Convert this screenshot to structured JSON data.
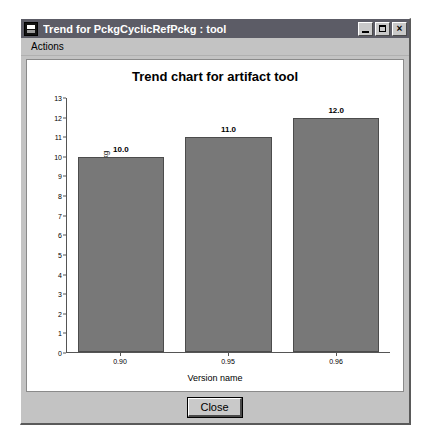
{
  "window": {
    "title": "Trend for PckgCyclicRefPckg : tool",
    "icon": "window-app-icon",
    "buttons": {
      "minimize": "_",
      "maximize": "□",
      "close": "×"
    }
  },
  "menubar": {
    "items": [
      {
        "label": "Actions"
      }
    ]
  },
  "footer": {
    "close_label": "Close"
  },
  "chart_data": {
    "type": "bar",
    "title": "Trend chart for artifact tool",
    "categories": [
      "0.90",
      "0.95",
      "0.96"
    ],
    "values": [
      10.0,
      12.0,
      12.0
    ],
    "bar_labels": [
      "10.0",
      "11.0",
      "12.0"
    ],
    "xlabel": "Version name",
    "ylabel": "Metric value for metric PckgCyclicRefPckg",
    "ylim": [
      0,
      13
    ],
    "yticks": [
      0,
      1,
      2,
      3,
      4,
      5,
      6,
      7,
      8,
      9,
      10,
      11,
      12,
      13
    ],
    "ytick_labels": [
      "0",
      "1",
      "2",
      "3",
      "4",
      "5",
      "6",
      "7",
      "8",
      "9",
      "10",
      "11",
      "12",
      "13"
    ],
    "grid": false,
    "legend": null,
    "series": [
      {
        "name": "tool",
        "values": [
          10.0,
          11.0,
          12.0
        ]
      }
    ],
    "bar_color": "#787878",
    "bar_border_color": "#4c4c4c"
  }
}
